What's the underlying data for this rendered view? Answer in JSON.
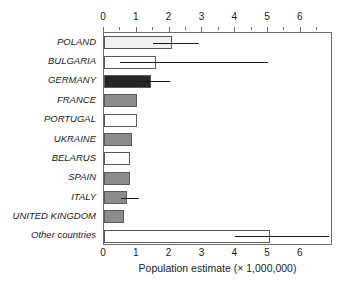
{
  "chart_data": {
    "type": "bar",
    "orientation": "horizontal",
    "title": "",
    "xlabel": "Population estimate (× 1,000,000)",
    "ylabel": "",
    "xlim": [
      0,
      6.98
    ],
    "xticks": [
      0,
      1,
      2,
      3,
      4,
      5,
      6
    ],
    "xticklabels": [
      "0",
      "1",
      "2",
      "3",
      "4",
      "5",
      "6"
    ],
    "minor_ticks": [
      0.5,
      1.5,
      2.5,
      3.5,
      4.5,
      5.5,
      6.5
    ],
    "grid": false,
    "legend": null,
    "axis_positions": [
      "top",
      "bottom"
    ],
    "categories": [
      "POLAND",
      "BULGARIA",
      "GERMANY",
      "FRANCE",
      "PORTUGAL",
      "UKRAINE",
      "BELARUS",
      "SPAIN",
      "ITALY",
      "UNITED KINGDOM",
      "Other countries"
    ],
    "values": [
      2.07,
      1.6,
      1.43,
      1.02,
      1.0,
      0.85,
      0.79,
      0.79,
      0.7,
      0.6,
      5.05
    ],
    "error_low": [
      1.5,
      0.5,
      1.02,
      null,
      null,
      null,
      null,
      null,
      0.53,
      null,
      3.98
    ],
    "error_high": [
      2.9,
      5.0,
      2.02,
      null,
      null,
      null,
      null,
      null,
      1.06,
      null,
      6.85
    ],
    "bar_colors": [
      "#f0f0f0",
      "#ffffff",
      "#262626",
      "#8c8c8c",
      "#fcfcfc",
      "#8c8c8c",
      "#ffffff",
      "#8c8c8c",
      "#8c8c8c",
      "#8c8c8c",
      "#ffffff"
    ],
    "bar_edge_color": "#5a5a5a",
    "error_bar_color": "#1a1a1a",
    "background_color": "#ffffff",
    "axis_color": "#6e6e6e"
  }
}
